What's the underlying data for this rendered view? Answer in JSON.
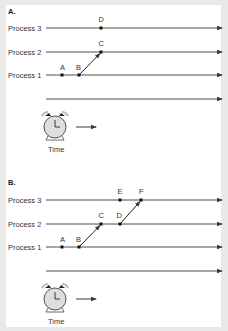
{
  "panels": [
    {
      "id": "A",
      "title": "A.",
      "processes": [
        {
          "label": "Process 3",
          "events": [
            {
              "name": "D",
              "x": 101
            }
          ]
        },
        {
          "label": "Process 2",
          "events": [
            {
              "name": "C",
              "x": 101
            }
          ]
        },
        {
          "label": "Process 1",
          "events": [
            {
              "name": "A",
              "x": 62
            },
            {
              "name": "B",
              "x": 79
            }
          ]
        }
      ],
      "messages": [
        {
          "from": "B",
          "to": "C"
        }
      ],
      "time_label": "Time"
    },
    {
      "id": "B",
      "title": "B.",
      "processes": [
        {
          "label": "Process 3",
          "events": [
            {
              "name": "E",
              "x": 120
            },
            {
              "name": "F",
              "x": 141
            }
          ]
        },
        {
          "label": "Process 2",
          "events": [
            {
              "name": "C",
              "x": 101
            },
            {
              "name": "D",
              "x": 120
            }
          ]
        },
        {
          "label": "Process 1",
          "events": [
            {
              "name": "A",
              "x": 62
            },
            {
              "name": "B",
              "x": 79
            }
          ]
        }
      ],
      "messages": [
        {
          "from": "B",
          "to": "C"
        },
        {
          "from": "D",
          "to": "F"
        }
      ],
      "time_label": "Time"
    }
  ],
  "colors": {
    "line": "#3a3a3a",
    "clock_fill": "#dcdcdc",
    "background": "#e9e9e7"
  }
}
